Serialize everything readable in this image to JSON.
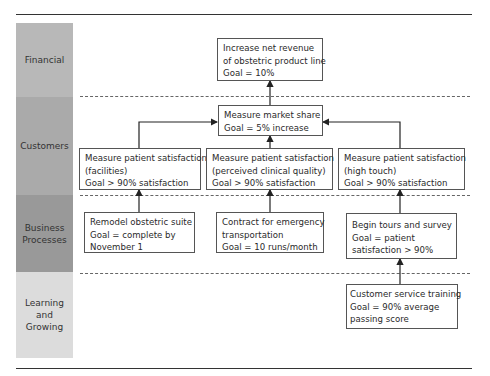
{
  "perspectives": [
    {
      "label": "Financial",
      "color": "#b8b8b8"
    },
    {
      "label": "Customers",
      "color": "#aaaaaa"
    },
    {
      "label": "Business Processes",
      "color": "#999999"
    },
    {
      "label": "Learning and Growing",
      "color": "#dcdcdc"
    }
  ],
  "nodes": {
    "financial": {
      "lines": [
        "Increase net revenue",
        "of obstetric product line",
        "Goal = 10%"
      ]
    },
    "market_share": {
      "lines": [
        "Measure market share",
        "Goal = 5% increase"
      ]
    },
    "sat_facilities": {
      "lines": [
        "Measure patient satisfaction",
        "(facilities)",
        "Goal  > 90% satisfaction"
      ]
    },
    "sat_clinical": {
      "lines": [
        "Measure patient satisfaction",
        "(perceived clinical quality)",
        "Goal  > 90% satisfaction"
      ]
    },
    "sat_high_touch": {
      "lines": [
        "Measure patient satisfaction",
        "(high touch)",
        "Goal  > 90% satisfaction"
      ]
    },
    "remodel": {
      "lines": [
        "Remodel obstetric suite",
        "Goal = complete by",
        "November 1"
      ]
    },
    "contract": {
      "lines": [
        "Contract for emergency",
        "transportation",
        "Goal = 10 runs/month"
      ]
    },
    "tours": {
      "lines": [
        "Begin tours and survey",
        "Goal = patient",
        "satisfaction  > 90%"
      ]
    },
    "training": {
      "lines": [
        "Customer service training",
        "Goal = 90% average",
        "passing score"
      ]
    }
  },
  "edges": [
    {
      "from": "market_share",
      "to": "financial"
    },
    {
      "from": "sat_facilities",
      "to": "market_share"
    },
    {
      "from": "sat_clinical",
      "to": "market_share"
    },
    {
      "from": "sat_high_touch",
      "to": "market_share"
    },
    {
      "from": "remodel",
      "to": "sat_facilities"
    },
    {
      "from": "contract",
      "to": "sat_clinical"
    },
    {
      "from": "tours",
      "to": "sat_high_touch"
    },
    {
      "from": "training",
      "to": "tours"
    }
  ]
}
